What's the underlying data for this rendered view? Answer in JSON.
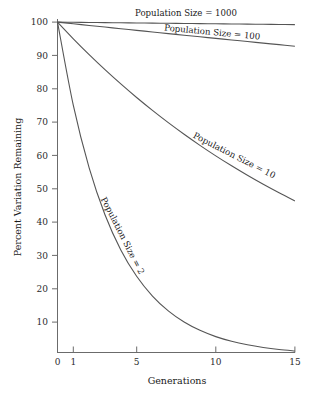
{
  "chart_data": {
    "type": "line",
    "title": "",
    "xlabel": "Generations",
    "ylabel": "Percent Variation Remaining",
    "xlim": [
      0,
      15
    ],
    "ylim": [
      0,
      100
    ],
    "grid": false,
    "legend_position": "inline-curve-labels",
    "xticks": [
      "0",
      "1",
      "5",
      "10",
      "15"
    ],
    "xtick_values": [
      0,
      1,
      5,
      10,
      15
    ],
    "yticks": [
      "10",
      "20",
      "30",
      "40",
      "50",
      "60",
      "70",
      "80",
      "90",
      "100"
    ],
    "ytick_values": [
      10,
      20,
      30,
      40,
      50,
      60,
      70,
      80,
      90,
      100
    ],
    "x": [
      0,
      1,
      2,
      3,
      4,
      5,
      6,
      7,
      8,
      9,
      10,
      11,
      12,
      13,
      14,
      15
    ],
    "series": [
      {
        "name": "Population Size = 1000",
        "label": "Population Size = 1000",
        "population_size": 1000,
        "values": [
          100,
          99.95,
          99.9,
          99.85,
          99.8,
          99.75,
          99.7,
          99.65,
          99.6,
          99.55,
          99.5,
          99.45,
          99.4,
          99.35,
          99.3,
          99.25
        ]
      },
      {
        "name": "Population Size = 100",
        "label": "Population Size = 100",
        "population_size": 100,
        "values": [
          100,
          99.5,
          99.0,
          98.51,
          98.02,
          97.52,
          97.04,
          96.55,
          96.07,
          95.59,
          95.11,
          94.64,
          94.16,
          93.69,
          93.23,
          92.76
        ]
      },
      {
        "name": "Population Size = 10",
        "label": "Population Size = 10",
        "population_size": 10,
        "values": [
          100,
          95.0,
          90.25,
          85.74,
          81.45,
          77.38,
          73.51,
          69.83,
          66.34,
          63.02,
          59.87,
          56.88,
          54.04,
          51.33,
          48.77,
          46.33
        ]
      },
      {
        "name": "Population Size = 2",
        "label": "Population Size = 2",
        "population_size": 2,
        "values": [
          100,
          75.0,
          56.25,
          42.19,
          31.64,
          23.73,
          17.8,
          13.35,
          10.01,
          7.51,
          5.63,
          4.22,
          3.17,
          2.38,
          1.78,
          1.34
        ]
      }
    ],
    "colors": {
      "line": "#555555",
      "axis": "#6b6b6b",
      "text": "#1a1a1a",
      "background": "#ffffff"
    }
  },
  "labels": {
    "series_1000": "Population Size = 1000",
    "series_100": "Population Size = 100",
    "series_10": "Population Size = 10",
    "series_2": "Population Size = 2",
    "xaxis_title": "Generations",
    "yaxis_title": "Percent Variation Remaining",
    "x0": "0",
    "x1": "1",
    "x5": "5",
    "x10": "10",
    "x15": "15",
    "y10": "10",
    "y20": "20",
    "y30": "30",
    "y40": "40",
    "y50": "50",
    "y60": "60",
    "y70": "70",
    "y80": "80",
    "y90": "90",
    "y100": "100"
  }
}
